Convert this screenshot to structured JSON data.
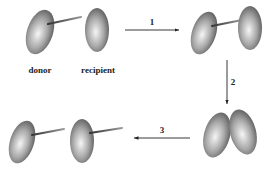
{
  "diagram": {
    "labels": {
      "donor": "donor",
      "recipient": "recipient"
    },
    "steps": [
      {
        "id": "1",
        "label": "1",
        "direction": "right"
      },
      {
        "id": "2",
        "label": "2",
        "direction": "down"
      },
      {
        "id": "3",
        "label": "3",
        "direction": "left"
      }
    ],
    "stages": [
      {
        "name": "initial",
        "description": "donor with pilus, recipient separate"
      },
      {
        "name": "pilus-attached",
        "description": "donor pilus attached to recipient"
      },
      {
        "name": "mating-pair",
        "description": "cells in direct contact"
      },
      {
        "name": "separated",
        "description": "both cells now carry pilus"
      }
    ],
    "colors": {
      "cell_light": "#f4f4f4",
      "cell_dark": "#555555",
      "line": "#222222"
    }
  }
}
